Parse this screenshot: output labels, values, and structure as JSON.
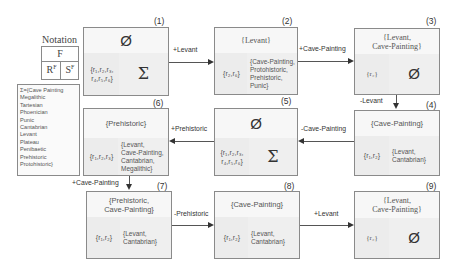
{
  "notation": {
    "title": "Notation",
    "top": "F",
    "bottom_left": "R",
    "bottom_left_sup": "F",
    "bottom_right": "S",
    "bottom_right_sup": "F"
  },
  "legend": {
    "lines": [
      "Σ={Cave Painting",
      "Megalithic",
      "Tartesian",
      "Phoenician",
      "Punic",
      "Cantabrian",
      "Levant",
      "Plateau",
      "Penibaetic",
      "Prehistoric",
      "Protohistoric}"
    ]
  },
  "boxes": [
    {
      "id": "(1)",
      "header": "Ø",
      "left": "{r1,r2,r3,\nr4,r5,r6}",
      "right": "Σ"
    },
    {
      "id": "(2)",
      "header": "{Levant}",
      "left": "{r2,r6}",
      "right": "{Cave-Painting,\nProtohistoric,\nPrehistoric,\nPunic}"
    },
    {
      "id": "(3)",
      "header": "{Levant,\nCave-Painting}",
      "left": "{r2}",
      "right": "Ø"
    },
    {
      "id": "(4)",
      "header": "{Cave-Painting}",
      "left": "{r1,r2}",
      "right": "{Levant,\nCantabrian}"
    },
    {
      "id": "(5)",
      "header": "Ø",
      "left": "{r1,r2,r3,\nr4,r5,r6}",
      "right": "Σ"
    },
    {
      "id": "(6)",
      "header": "{Prehistoric}",
      "left": "{r1,r2,r3}",
      "right": "{Levant,\nCave-Painting,\nCantabrian,\nMegalithic}"
    },
    {
      "id": "(7)",
      "header": "{Prehistoric,\nCave-Painting}",
      "left": "{r1,r2}",
      "right": "{Levant,\nCantabrian}"
    },
    {
      "id": "(8)",
      "header": "{Cave-Painting}",
      "left": "{r1,r2}",
      "right": "{Levant,\nCantabrian}"
    },
    {
      "id": "(9)",
      "header": "{Levant,\nCave-Painting}",
      "left": "{r2}",
      "right": "Ø"
    }
  ],
  "transitions": [
    {
      "from": "(1)",
      "to": "(2)",
      "label": "+Levant"
    },
    {
      "from": "(2)",
      "to": "(3)",
      "label": "+Cave-Painting"
    },
    {
      "from": "(3)",
      "to": "(4)",
      "label": "-Levant"
    },
    {
      "from": "(4)",
      "to": "(5)",
      "label": "-Cave-Painting"
    },
    {
      "from": "(5)",
      "to": "(6)",
      "label": "+Prehistoric"
    },
    {
      "from": "(6)",
      "to": "(7)",
      "label": "+Cave-Painting"
    },
    {
      "from": "(7)",
      "to": "(8)",
      "label": "-Prehistoric"
    },
    {
      "from": "(8)",
      "to": "(9)",
      "label": "+Levant"
    }
  ]
}
